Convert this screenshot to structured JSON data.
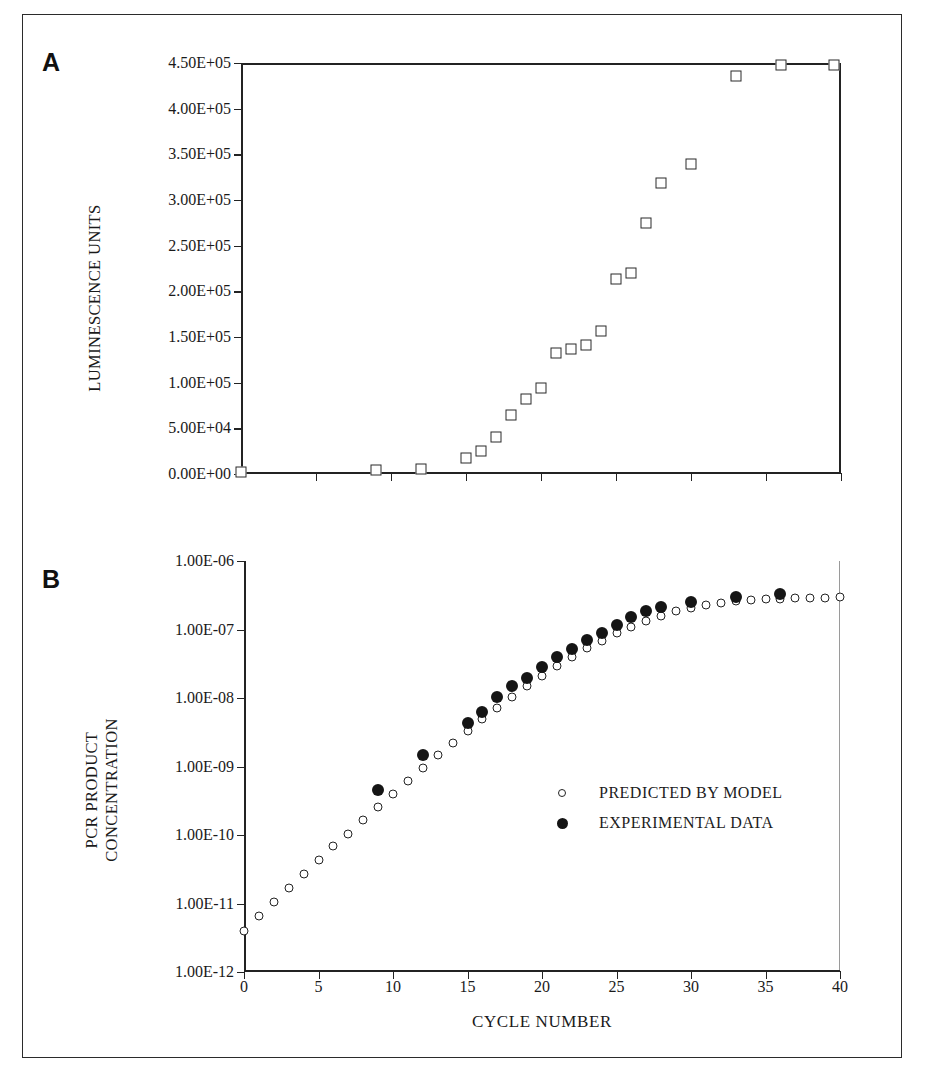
{
  "figure": {
    "panel_a_letter": "A",
    "panel_b_letter": "B"
  },
  "legend": {
    "predicted_label": "PREDICTED BY MODEL",
    "experimental_label": "EXPERIMENTAL DATA",
    "predicted_marker": "open-circle",
    "experimental_marker": "filled-circle"
  },
  "colors": {
    "ink": "#232323",
    "marker_fill": "#151515",
    "background": "#ffffff"
  },
  "chart_data": [
    {
      "id": "panel-a",
      "type": "scatter",
      "title": "A",
      "xlabel": "",
      "ylabel": "LUMINESCENCE UNITS",
      "xlim": [
        0,
        40
      ],
      "ylim": [
        0,
        450000
      ],
      "xticks": [
        0,
        5,
        10,
        15,
        20,
        25,
        30,
        35,
        40
      ],
      "xticklabels": [
        "",
        "",
        "",
        "",
        "",
        "",
        "",
        "",
        ""
      ],
      "yticks": [
        0,
        50000,
        100000,
        150000,
        200000,
        250000,
        300000,
        350000,
        400000,
        450000
      ],
      "yticklabels": [
        "0.00E+00",
        "5.00E+04",
        "1.00E+05",
        "1.50E+05",
        "2.00E+05",
        "2.50E+05",
        "3.00E+05",
        "3.50E+05",
        "4.00E+05",
        "4.50E+05"
      ],
      "grid": false,
      "legend_position": "none",
      "series": [
        {
          "name": "LUMINESCENCE UNITS",
          "marker": "open-square",
          "x": [
            0,
            9,
            12,
            15,
            16,
            17,
            18,
            19,
            20,
            21,
            22,
            23,
            24,
            25,
            26,
            27,
            28,
            30,
            33,
            36,
            39.5
          ],
          "y": [
            2000,
            4000,
            5500,
            18000,
            25000,
            41000,
            65000,
            82000,
            94000,
            133000,
            137000,
            141000,
            157000,
            213000,
            220000,
            275000,
            319000,
            339000,
            436000,
            448000,
            448000
          ]
        }
      ]
    },
    {
      "id": "panel-b",
      "type": "scatter",
      "title": "B",
      "xlabel": "CYCLE NUMBER",
      "ylabel": "PCR PRODUCT CONCENTRATION",
      "ylabel_line1": "PCR PRODUCT",
      "ylabel_line2": "CONCENTRATION",
      "xlim": [
        0,
        40
      ],
      "ylim_log": [
        1e-12,
        1e-06
      ],
      "yscale": "log",
      "xticks": [
        0,
        5,
        10,
        15,
        20,
        25,
        30,
        35,
        40
      ],
      "xticklabels": [
        "0",
        "5",
        "10",
        "15",
        "20",
        "25",
        "30",
        "35",
        "40"
      ],
      "yticks": [
        1e-12,
        1e-11,
        1e-10,
        1e-09,
        1e-08,
        1e-07,
        1e-06
      ],
      "yticklabels": [
        "1.00E-12",
        "1.00E-11",
        "1.00E-10",
        "1.00E-09",
        "1.00E-08",
        "1.00E-07",
        "1.00E-06"
      ],
      "grid": false,
      "legend_position": "inside-right",
      "series": [
        {
          "name": "PREDICTED BY MODEL",
          "marker": "open-circle",
          "x": [
            0,
            1,
            2,
            3,
            4,
            5,
            6,
            7,
            8,
            9,
            10,
            11,
            12,
            13,
            14,
            15,
            16,
            17,
            18,
            19,
            20,
            21,
            22,
            23,
            24,
            25,
            26,
            27,
            28,
            29,
            30,
            31,
            32,
            33,
            34,
            35,
            36,
            37,
            38,
            39,
            40
          ],
          "y": [
            4e-12,
            6.5e-12,
            1.05e-11,
            1.7e-11,
            2.7e-11,
            4.3e-11,
            6.8e-11,
            1.05e-10,
            1.65e-10,
            2.6e-10,
            4e-10,
            6.2e-10,
            9.5e-10,
            1.45e-09,
            2.2e-09,
            3.3e-09,
            4.9e-09,
            7.2e-09,
            1.05e-08,
            1.5e-08,
            2.1e-08,
            2.9e-08,
            4e-08,
            5.3e-08,
            6.9e-08,
            8.8e-08,
            1.1e-07,
            1.35e-07,
            1.6e-07,
            1.85e-07,
            2.08e-07,
            2.28e-07,
            2.44e-07,
            2.57e-07,
            2.67e-07,
            2.75e-07,
            2.81e-07,
            2.86e-07,
            2.9e-07,
            2.93e-07,
            2.96e-07
          ]
        },
        {
          "name": "EXPERIMENTAL DATA",
          "marker": "filled-circle",
          "x": [
            9,
            12,
            15,
            16,
            17,
            18,
            19,
            20,
            21,
            22,
            23,
            24,
            25,
            26,
            27,
            28,
            30,
            33,
            36
          ],
          "y": [
            3.9e-10,
            1.25e-09,
            3.6e-09,
            5.2e-09,
            8.6e-09,
            1.25e-08,
            1.65e-08,
            2.4e-08,
            3.3e-08,
            4.4e-08,
            5.9e-08,
            7.6e-08,
            9.8e-08,
            1.28e-07,
            1.55e-07,
            1.8e-07,
            2.15e-07,
            2.55e-07,
            2.75e-07
          ]
        }
      ]
    }
  ]
}
